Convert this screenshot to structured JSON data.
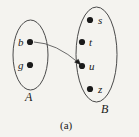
{
  "figure": {
    "caption": "(a)",
    "type": "set-mapping-diagram",
    "background_color": "#f4f3ef",
    "ink_color": "#1a1a1a",
    "stroke_color": "#4a4a4a"
  },
  "sets": [
    {
      "id": "A",
      "label": "A",
      "label_x": 25,
      "label_y": 91,
      "ellipse": {
        "cx": 30.5,
        "cy": 55,
        "rx": 17.5,
        "ry": 35
      },
      "elements": [
        {
          "id": "b",
          "label": "b",
          "dot_x": 30,
          "dot_y": 42,
          "label_side": "left"
        },
        {
          "id": "g",
          "label": "g",
          "dot_x": 30,
          "dot_y": 65,
          "label_side": "left"
        }
      ]
    },
    {
      "id": "B",
      "label": "B",
      "label_x": 101,
      "label_y": 103,
      "ellipse": {
        "cx": 96.5,
        "cy": 54.5,
        "rx": 20.5,
        "ry": 47.5
      },
      "elements": [
        {
          "id": "s",
          "label": "s",
          "dot_x": 90,
          "dot_y": 20,
          "label_side": "right"
        },
        {
          "id": "t",
          "label": "t",
          "dot_x": 82,
          "dot_y": 42,
          "label_side": "right"
        },
        {
          "id": "u",
          "label": "u",
          "dot_x": 82,
          "dot_y": 66,
          "label_side": "right"
        },
        {
          "id": "z",
          "label": "z",
          "dot_x": 90,
          "dot_y": 89,
          "label_side": "right"
        }
      ]
    }
  ],
  "arrows": [
    {
      "id": "b-to-u",
      "from": "b",
      "to": "u",
      "from_x": 34,
      "from_y": 42,
      "to_x": 79,
      "to_y": 63,
      "control_x": 55,
      "control_y": 44,
      "has_arrowhead": true
    }
  ]
}
